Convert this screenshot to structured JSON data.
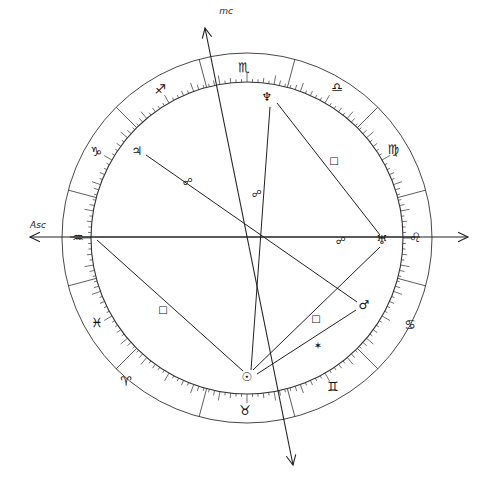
{
  "chart": {
    "center": [
      247,
      238
    ],
    "outer_radius": 185,
    "inner_radius": 156,
    "stroke_color": "#333333",
    "background": "#ffffff"
  },
  "axes": {
    "asc": {
      "label": "Asc",
      "from": [
        420,
        237
      ],
      "to": [
        30,
        237
      ],
      "label_pos": [
        38,
        228
      ]
    },
    "dsc": {
      "from": [
        70,
        237
      ],
      "to": [
        468,
        237
      ]
    },
    "mc": {
      "label": "mc",
      "top": [
        205,
        28
      ],
      "bottom": [
        293,
        465
      ],
      "label_pos": [
        226,
        14
      ]
    }
  },
  "signs": [
    {
      "name": "scorpio",
      "glyph": "♏",
      "pos": [
        244,
        67
      ]
    },
    {
      "name": "libra",
      "glyph": "♎",
      "pos": [
        337,
        87
      ]
    },
    {
      "name": "virgo",
      "glyph": "♍",
      "pos": [
        393,
        149
      ]
    },
    {
      "name": "leo",
      "glyph": "♌",
      "pos": [
        415,
        237
      ]
    },
    {
      "name": "cancer",
      "glyph": "♋",
      "pos": [
        410,
        324
      ]
    },
    {
      "name": "gemini",
      "glyph": "♊",
      "pos": [
        333,
        386
      ]
    },
    {
      "name": "taurus",
      "glyph": "♉",
      "pos": [
        245,
        410
      ]
    },
    {
      "name": "aries",
      "glyph": "♈",
      "pos": [
        126,
        381
      ]
    },
    {
      "name": "pisces",
      "glyph": "♓",
      "pos": [
        97,
        322
      ]
    },
    {
      "name": "aquarius",
      "glyph": "♒",
      "pos": [
        78,
        237
      ]
    },
    {
      "name": "capricorn",
      "glyph": "♑",
      "pos": [
        96,
        151
      ]
    },
    {
      "name": "sagittarius",
      "glyph": "♐",
      "pos": [
        160,
        89
      ]
    }
  ],
  "house_cusps_deg": [
    15,
    45,
    75,
    105,
    135,
    165,
    195,
    225,
    255,
    285,
    315,
    345
  ],
  "planets": [
    {
      "name": "neptune",
      "glyph": "♆",
      "pos": [
        267,
        97
      ]
    },
    {
      "name": "jupiter",
      "glyph": "♃",
      "pos": [
        137,
        151
      ]
    },
    {
      "name": "uranus",
      "glyph": "♅",
      "pos": [
        382,
        240
      ]
    },
    {
      "name": "mars",
      "glyph": "♂",
      "pos": [
        364,
        305
      ]
    },
    {
      "name": "sun",
      "glyph": "☉",
      "pos": [
        247,
        377
      ]
    },
    {
      "name": "aquarius-point",
      "glyph": "",
      "pos": [
        92,
        240
      ]
    }
  ],
  "aspect_lines": [
    {
      "name": "jupiter-mars-opposition",
      "from": [
        146,
        155
      ],
      "to": [
        357,
        302
      ],
      "symbol": "☍",
      "symbol_pos": [
        188,
        181
      ]
    },
    {
      "name": "neptune-sun-opposition",
      "from": [
        270,
        107
      ],
      "to": [
        251,
        370
      ],
      "symbol": "☍",
      "symbol_pos": [
        257,
        193
      ]
    },
    {
      "name": "neptune-uranus-square",
      "from": [
        277,
        103
      ],
      "to": [
        380,
        235
      ],
      "symbol": "□",
      "symbol_pos": [
        334,
        160
      ]
    },
    {
      "name": "uranus-sun-square",
      "from": [
        380,
        247
      ],
      "to": [
        253,
        370
      ],
      "symbol": "□",
      "symbol_pos": [
        316,
        318
      ]
    },
    {
      "name": "mars-sun-sextile",
      "from": [
        356,
        310
      ],
      "to": [
        257,
        374
      ],
      "symbol": "✶",
      "symbol_pos": [
        318,
        345
      ]
    },
    {
      "name": "aquarius-sun-square",
      "from": [
        97,
        240
      ],
      "to": [
        243,
        371
      ],
      "symbol": "□",
      "symbol_pos": [
        163,
        309
      ]
    }
  ],
  "extra_symbols": [
    {
      "name": "uranus-opposition-marker",
      "symbol": "☍",
      "pos": [
        341,
        240
      ]
    }
  ]
}
